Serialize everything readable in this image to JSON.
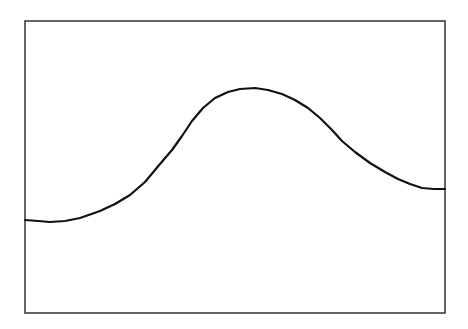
{
  "chart_data": {
    "type": "line",
    "title": "",
    "xlabel": "",
    "ylabel": "",
    "grid": false,
    "legend": null,
    "frame_px": {
      "left": 25,
      "top": 21,
      "right": 445,
      "bottom": 313
    },
    "series": [
      {
        "name": "curve",
        "color": "#111111",
        "points_px": [
          [
            25,
            220
          ],
          [
            38,
            221
          ],
          [
            50,
            222
          ],
          [
            65,
            221
          ],
          [
            80,
            218
          ],
          [
            100,
            211
          ],
          [
            115,
            204
          ],
          [
            130,
            195
          ],
          [
            145,
            182
          ],
          [
            160,
            164
          ],
          [
            172,
            150
          ],
          [
            182,
            136
          ],
          [
            192,
            121
          ],
          [
            203,
            108
          ],
          [
            215,
            98
          ],
          [
            228,
            92
          ],
          [
            240,
            89
          ],
          [
            255,
            88
          ],
          [
            268,
            90
          ],
          [
            282,
            94
          ],
          [
            295,
            100
          ],
          [
            308,
            108
          ],
          [
            320,
            118
          ],
          [
            332,
            130
          ],
          [
            342,
            141
          ],
          [
            355,
            152
          ],
          [
            370,
            163
          ],
          [
            385,
            172
          ],
          [
            398,
            179
          ],
          [
            410,
            184
          ],
          [
            422,
            188
          ],
          [
            434,
            189
          ],
          [
            445,
            189
          ]
        ]
      }
    ]
  }
}
